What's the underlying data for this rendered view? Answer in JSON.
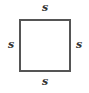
{
  "diagram": {
    "shape": "square",
    "labels": {
      "top": "s",
      "left": "s",
      "right": "s",
      "bottom": "s"
    },
    "stroke_color": "#555555"
  }
}
